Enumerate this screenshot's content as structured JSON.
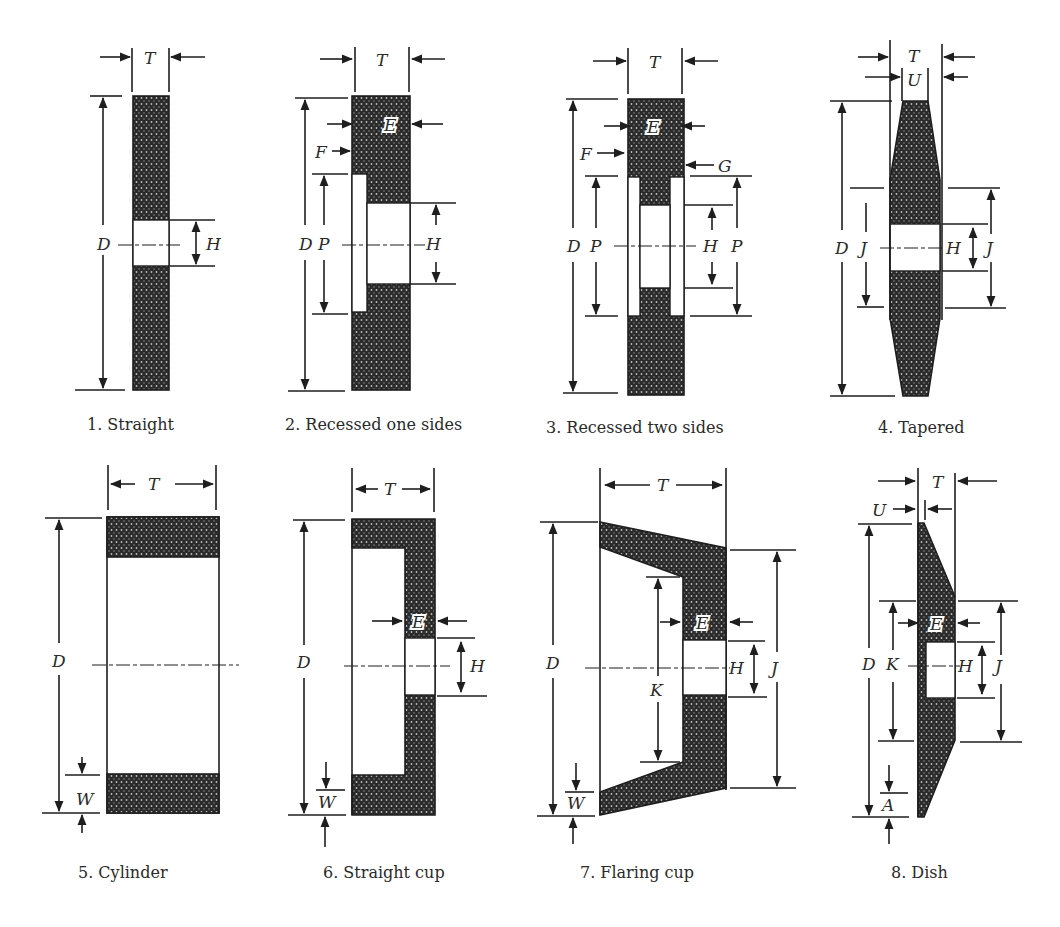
{
  "figure": {
    "panels": [
      {
        "id": 1,
        "caption": "1. Straight",
        "labels": {
          "T": "T",
          "D": "D",
          "H": "H"
        }
      },
      {
        "id": 2,
        "caption": "2. Recessed one sides",
        "labels": {
          "T": "T",
          "E": "E",
          "F": "F",
          "D": "D",
          "P": "P",
          "H": "H"
        }
      },
      {
        "id": 3,
        "caption": "3. Recessed two sides",
        "labels": {
          "T": "T",
          "E": "E",
          "F": "F",
          "G": "G",
          "D": "D",
          "P": "P",
          "H": "H",
          "P2": "P"
        }
      },
      {
        "id": 4,
        "caption": "4. Tapered",
        "labels": {
          "T": "T",
          "U": "U",
          "D": "D",
          "J": "J",
          "H": "H",
          "J2": "J"
        }
      },
      {
        "id": 5,
        "caption": "5. Cylinder",
        "labels": {
          "T": "T",
          "D": "D",
          "W": "W"
        }
      },
      {
        "id": 6,
        "caption": "6. Straight cup",
        "labels": {
          "T": "T",
          "D": "D",
          "E": "E",
          "H": "H",
          "W": "W"
        }
      },
      {
        "id": 7,
        "caption": "7. Flaring cup",
        "labels": {
          "T": "T",
          "D": "D",
          "K": "K",
          "E": "E",
          "H": "H",
          "J": "J",
          "W": "W"
        }
      },
      {
        "id": 8,
        "caption": "8. Dish",
        "labels": {
          "T": "T",
          "U": "U",
          "D": "D",
          "K": "K",
          "E": "E",
          "H": "H",
          "J": "J",
          "A": "A"
        }
      }
    ],
    "colors": {
      "line": "#1e1e1e",
      "fill_dark": "#2b2b2b",
      "fill_light": "#bdbdbd",
      "background": "#ffffff"
    }
  }
}
